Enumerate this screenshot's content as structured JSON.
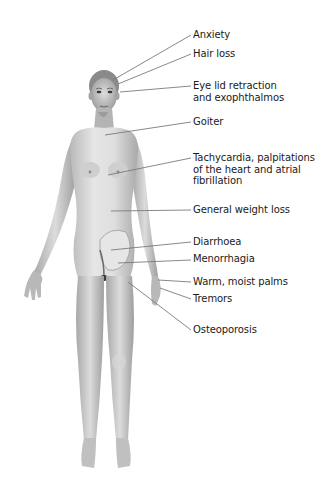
{
  "diagram": {
    "line_color": "#7a7a7a",
    "labels": [
      {
        "id": "anxiety",
        "text": "Anxiety",
        "top": 29,
        "from": [
          193,
          35
        ],
        "to": [
          113,
          80
        ]
      },
      {
        "id": "hair-loss",
        "text": "Hair loss",
        "top": 48,
        "from": [
          193,
          54
        ],
        "to": [
          118,
          84
        ]
      },
      {
        "id": "eye-lid",
        "text": "Eye lid retraction\nand exophthalmos",
        "top": 80,
        "from": [
          193,
          86
        ],
        "to": [
          120,
          92
        ]
      },
      {
        "id": "goiter",
        "text": "Goiter",
        "top": 116,
        "from": [
          193,
          122
        ],
        "to": [
          105,
          135
        ]
      },
      {
        "id": "tachycardia",
        "text": "Tachycardia, palpitations\nof the heart and atrial\nfibrillation",
        "top": 152,
        "from": [
          193,
          158
        ],
        "to": [
          108,
          175
        ]
      },
      {
        "id": "weight-loss",
        "text": "General weight loss",
        "top": 204,
        "from": [
          193,
          210
        ],
        "to": [
          111,
          211
        ]
      },
      {
        "id": "diarrhoea",
        "text": "Diarrhoea",
        "top": 236,
        "from": [
          193,
          242
        ],
        "to": [
          111,
          250
        ]
      },
      {
        "id": "menorrhagia",
        "text": "Menorrhagia",
        "top": 253,
        "from": [
          193,
          260
        ],
        "to": [
          118,
          263
        ]
      },
      {
        "id": "warm-palms",
        "text": "Warm, moist palms",
        "top": 276,
        "from": [
          193,
          282
        ],
        "to": [
          158,
          280
        ]
      },
      {
        "id": "tremors",
        "text": "Tremors",
        "top": 293,
        "from": [
          193,
          299
        ],
        "to": [
          160,
          288
        ]
      },
      {
        "id": "osteoporosis",
        "text": "Osteoporosis",
        "top": 324,
        "from": [
          193,
          330
        ],
        "to": [
          128,
          282
        ]
      }
    ]
  }
}
